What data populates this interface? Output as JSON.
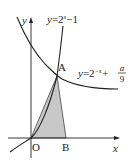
{
  "diagram": {
    "type": "function-graph",
    "axes": {
      "x_label": "x",
      "y_label": "y",
      "origin_label": "O"
    },
    "curves": [
      {
        "name": "exponential-growth",
        "label_lhs": "y",
        "label_eq": "=",
        "label_base": "2",
        "label_exp": "x",
        "label_tail": "−1"
      },
      {
        "name": "exponential-decay",
        "label_lhs": "y",
        "label_eq": "=",
        "label_base": "2",
        "label_exp": "−x",
        "label_plus": "+",
        "frac_num": "a",
        "frac_den": "9"
      }
    ],
    "points": {
      "A": "A",
      "B": "B"
    },
    "shaded_region": "triangle OAB",
    "colors": {
      "stroke": "#222222",
      "fill": "#c8c8c8"
    }
  }
}
